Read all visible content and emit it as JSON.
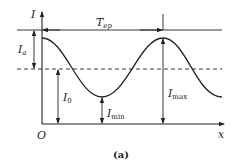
{
  "diagram": {
    "axes": {
      "y_label": "I",
      "x_label": "x",
      "origin_label": "O"
    },
    "labels": {
      "period_main": "T",
      "period_sub": "ep",
      "amplitude_main": "I",
      "amplitude_sub": "a",
      "mean_main": "I",
      "mean_sub": "0",
      "min_main": "I",
      "min_sub": "min",
      "max_main": "I",
      "max_sub": "max"
    },
    "caption": "(a)",
    "colors": {
      "line": "#222222",
      "background": "#ffffff"
    }
  }
}
